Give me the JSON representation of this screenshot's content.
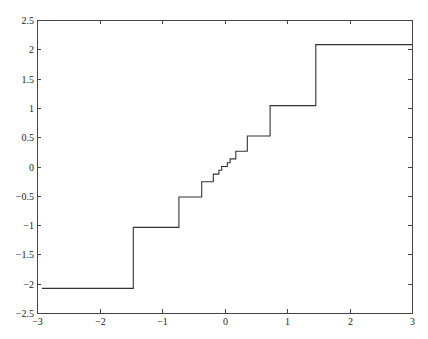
{
  "chart_data": {
    "type": "line",
    "subtype": "step",
    "title": "",
    "xlabel": "",
    "ylabel": "",
    "xlim": [
      -3,
      3
    ],
    "ylim": [
      -2.5,
      2.5
    ],
    "grid": false,
    "legend": null,
    "x_ticks": [
      -3,
      -2,
      -1,
      0,
      1,
      2,
      3
    ],
    "x_tick_labels": [
      "−3",
      "−2",
      "−1",
      "0",
      "1",
      "2",
      "3"
    ],
    "y_ticks": [
      2.5,
      2,
      1.5,
      1,
      0.5,
      0,
      -0.5,
      -1,
      -1.5,
      -2,
      -2.5
    ],
    "y_tick_labels": [
      "2.5",
      "2",
      "1.5",
      "1",
      "0.5",
      "0",
      "−0.5",
      "−1",
      "−1.5",
      "−2",
      "−2.5"
    ],
    "series": [
      {
        "name": "quantizer",
        "color": "#333333",
        "x": [
          -2.92,
          -1.46,
          -1.46,
          -0.73,
          -0.73,
          -0.365,
          -0.365,
          -0.18,
          -0.18,
          -0.09,
          -0.09,
          -0.045,
          -0.045,
          0.045,
          0.045,
          0.09,
          0.09,
          0.18,
          0.18,
          0.365,
          0.365,
          0.73,
          0.73,
          1.46,
          1.46,
          3.0
        ],
        "y": [
          -2.08,
          -2.08,
          -1.04,
          -1.04,
          -0.52,
          -0.52,
          -0.26,
          -0.26,
          -0.13,
          -0.13,
          -0.065,
          -0.065,
          0.0,
          0.0,
          0.065,
          0.065,
          0.13,
          0.13,
          0.26,
          0.26,
          0.52,
          0.52,
          1.04,
          1.04,
          2.08,
          2.08
        ]
      }
    ]
  }
}
